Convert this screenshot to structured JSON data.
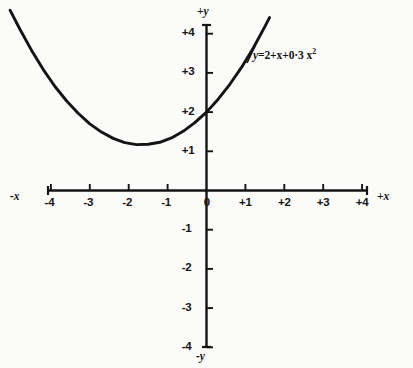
{
  "chart_data": {
    "type": "line",
    "title": "",
    "subtitle": "",
    "xlabel": "+x",
    "xlabel_negative": "-x",
    "ylabel": "+y",
    "ylabel_negative": "-y",
    "xlim": [
      -4.6,
      4.6
    ],
    "ylim": [
      -4.4,
      4.4
    ],
    "grid": false,
    "legend": "none",
    "equation_label": {
      "lhs": "y",
      "eq": "=",
      "rhs": "2+x+0·3 x",
      "exponent": "2",
      "full": "y=2+x+0·3 x²",
      "coefficients": {
        "constant": 2,
        "linear": 1,
        "quadratic": 0.3
      }
    },
    "x_ticks": [
      -4,
      -3,
      -2,
      -1,
      0,
      1,
      2,
      3,
      4
    ],
    "x_tick_labels": [
      "-4",
      "-3",
      "-2",
      "-1",
      "0",
      "+1",
      "+2",
      "+3",
      "+4"
    ],
    "y_ticks": [
      -4,
      -3,
      -2,
      -1,
      1,
      2,
      3,
      4
    ],
    "y_tick_labels": [
      "-4",
      "-3",
      "-2",
      "-1",
      "+1",
      "+2",
      "+3",
      "+4"
    ],
    "origin_label": "0",
    "series": [
      {
        "name": "y=2+x+0·3 x²",
        "color": "#141414",
        "x": [
          -5.05,
          -4.8,
          -4.5,
          -4.2,
          -3.9,
          -3.6,
          -3.3,
          -3.0,
          -2.7,
          -2.4,
          -2.1,
          -1.8,
          -1.5,
          -1.2,
          -0.9,
          -0.6,
          -0.3,
          0.0,
          0.3,
          0.6,
          0.9,
          1.2,
          1.5,
          1.62
        ],
        "y": [
          4.6,
          4.12,
          3.58,
          3.09,
          2.66,
          2.29,
          1.97,
          1.7,
          1.49,
          1.33,
          1.22,
          1.17,
          1.18,
          1.23,
          1.34,
          1.51,
          1.73,
          2.0,
          2.33,
          2.71,
          3.14,
          3.63,
          4.18,
          4.41
        ]
      }
    ]
  },
  "axes": {
    "x_axis_name": "x-axis",
    "y_axis_name": "y-axis"
  }
}
